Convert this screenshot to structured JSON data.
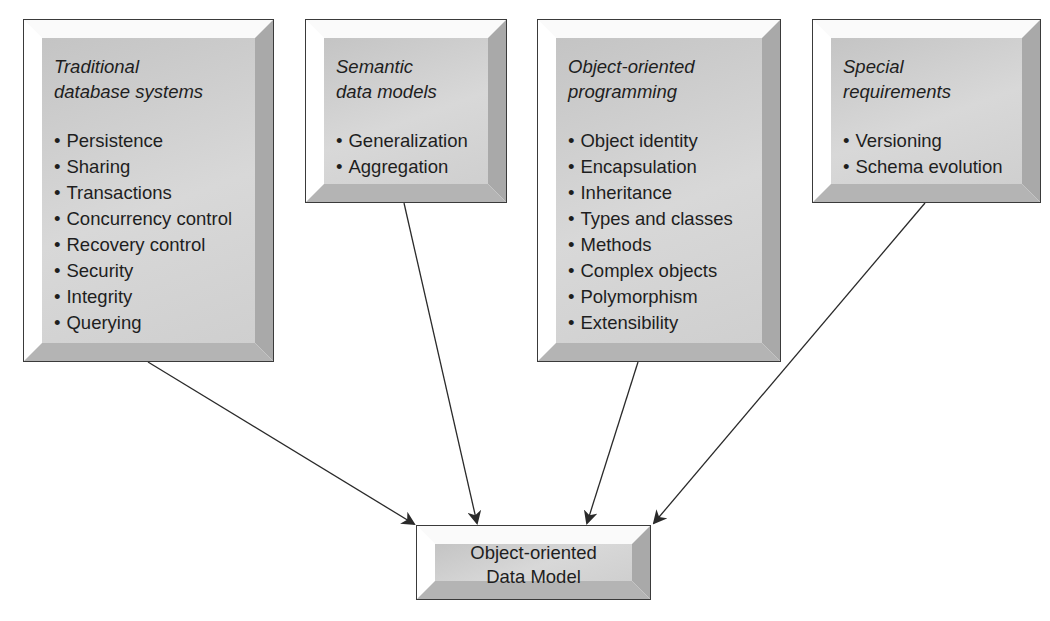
{
  "diagram": {
    "type": "flow",
    "sources": [
      {
        "title": "Traditional database systems",
        "title_lines": [
          "Traditional",
          "database systems"
        ],
        "items": [
          "Persistence",
          "Sharing",
          "Transactions",
          "Concurrency control",
          "Recovery control",
          "Security",
          "Integrity",
          "Querying"
        ]
      },
      {
        "title": "Semantic data models",
        "title_lines": [
          "Semantic",
          "data models"
        ],
        "items": [
          "Generalization",
          "Aggregation"
        ]
      },
      {
        "title": "Object-oriented programming",
        "title_lines": [
          "Object-oriented",
          "programming"
        ],
        "items": [
          "Object identity",
          "Encapsulation",
          "Inheritance",
          "Types and classes",
          "Methods",
          "Complex objects",
          "Polymorphism",
          "Extensibility"
        ]
      },
      {
        "title": "Special requirements",
        "title_lines": [
          "Special",
          "requirements"
        ],
        "items": [
          "Versioning",
          "Schema evolution"
        ]
      }
    ],
    "target": {
      "label": "Object-oriented Data Model",
      "label_lines": [
        "Object-oriented",
        "Data Model"
      ]
    },
    "edges": [
      {
        "from": "Traditional database systems",
        "to": "Object-oriented Data Model"
      },
      {
        "from": "Semantic data models",
        "to": "Object-oriented Data Model"
      },
      {
        "from": "Object-oriented programming",
        "to": "Object-oriented Data Model"
      },
      {
        "from": "Special requirements",
        "to": "Object-oriented Data Model"
      }
    ]
  },
  "colors": {
    "face": "#d0d0d0",
    "border": "#3a3a3a",
    "arrow": "#2a2a2a",
    "background": "#ffffff"
  }
}
